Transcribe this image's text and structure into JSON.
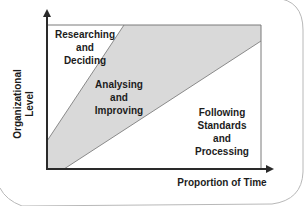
{
  "diagram": {
    "title": "",
    "x_axis_label": "Proportion of Time",
    "y_axis_label_lines": [
      "Organizational",
      "Level"
    ],
    "regions": [
      {
        "name": "researching-and-deciding",
        "lines": [
          "Researching",
          "and",
          "Deciding"
        ],
        "fill": "#ffffff"
      },
      {
        "name": "analysing-and-improving",
        "lines": [
          "Analysing",
          "and",
          "Improving"
        ],
        "fill": "#d9d9d9"
      },
      {
        "name": "following-standards-and-processing",
        "lines": [
          "Following",
          "Standards",
          "and",
          "Processing"
        ],
        "fill": "#ffffff"
      }
    ],
    "colors": {
      "axis": "#2a2a2a",
      "border": "#7a7a7a",
      "shaded_region": "#d9d9d9",
      "text": "#1c1c1c",
      "frame": "#b0b0b0"
    }
  }
}
